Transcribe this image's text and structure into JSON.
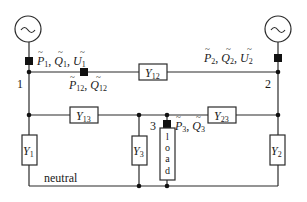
{
  "diagram": {
    "type": "power-network-circuit",
    "sources": [
      {
        "id": "source-1",
        "symbol": "~",
        "bus": "1"
      },
      {
        "id": "source-2",
        "symbol": "~",
        "bus": "2"
      }
    ],
    "nodes": [
      {
        "id": "1",
        "label": "1"
      },
      {
        "id": "2",
        "label": "2"
      },
      {
        "id": "3",
        "label": "3"
      }
    ],
    "measurements": {
      "m1": {
        "P": "P",
        "Q": "Q",
        "U": "U",
        "sub": "1",
        "text": "P̃1, Q̃1, Ũ1"
      },
      "m2": {
        "P": "P",
        "Q": "Q",
        "U": "U",
        "sub": "2",
        "text": "P̃2, Q̃2, Ũ2"
      },
      "m12": {
        "P": "P",
        "Q": "Q",
        "sub": "12",
        "text": "P̃12, Q̃12"
      },
      "m3": {
        "P": "P",
        "Q": "Q",
        "sub": "3",
        "text": "P̃3, Q̃3"
      }
    },
    "admittances": {
      "y12": {
        "base": "Y",
        "sub": "12"
      },
      "y13": {
        "base": "Y",
        "sub": "13"
      },
      "y23": {
        "base": "Y",
        "sub": "23"
      },
      "y1": {
        "base": "Y",
        "sub": "1"
      },
      "y2": {
        "base": "Y",
        "sub": "2"
      },
      "y3": {
        "base": "Y",
        "sub": "3"
      }
    },
    "load": {
      "letters": [
        "l",
        "o",
        "a",
        "d"
      ],
      "text": "load"
    },
    "neutral_label": "neutral",
    "comma": ", "
  }
}
